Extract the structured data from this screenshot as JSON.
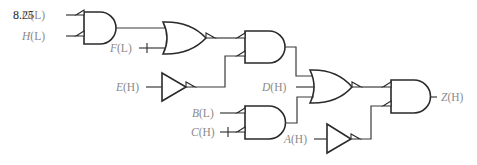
{
  "figure": {
    "number": "8.25",
    "type": "logic-circuit",
    "colors": {
      "gate_stroke": "#2a2a2a",
      "wire": "#3a3a3a",
      "label": "#8a8a8a",
      "figure_number": "#1a1a1a"
    }
  },
  "inputs": [
    {
      "id": "G",
      "letter": "G",
      "polarity": "(L)",
      "label": "G(L)"
    },
    {
      "id": "H",
      "letter": "H",
      "polarity": "(L)",
      "label": "H(L)"
    },
    {
      "id": "F",
      "letter": "F",
      "polarity": "(L)",
      "label": "F(L)",
      "mismatch_tick": true
    },
    {
      "id": "E",
      "letter": "E",
      "polarity": "(H)",
      "label": "E(H)"
    },
    {
      "id": "D",
      "letter": "D",
      "polarity": "(H)",
      "label": "D(H)"
    },
    {
      "id": "B",
      "letter": "B",
      "polarity": "(L)",
      "label": "B(L)"
    },
    {
      "id": "C",
      "letter": "C",
      "polarity": "(H)",
      "label": "C(H)",
      "mismatch_tick": true
    },
    {
      "id": "A",
      "letter": "A",
      "polarity": "(H)",
      "label": "A(H)"
    }
  ],
  "outputs": [
    {
      "id": "Z",
      "letter": "Z",
      "polarity": "(H)",
      "label": "Z(H)"
    }
  ],
  "gates": [
    {
      "id": "and1",
      "type": "AND",
      "inputs": [
        "G",
        "H"
      ],
      "input_bubbles": true,
      "output_bubble": false
    },
    {
      "id": "or1",
      "type": "OR",
      "inputs": [
        "and1",
        "F"
      ],
      "input_bubbles": false,
      "output_bubble": true
    },
    {
      "id": "buf_e",
      "type": "BUFFER",
      "inputs": [
        "E"
      ],
      "output_bubble": true
    },
    {
      "id": "and2",
      "type": "AND",
      "inputs": [
        "or1",
        "buf_e"
      ],
      "input_bubbles": true,
      "output_bubble": false
    },
    {
      "id": "and4",
      "type": "AND",
      "inputs": [
        "B",
        "C"
      ],
      "input_bubbles": true,
      "output_bubble": false
    },
    {
      "id": "or2",
      "type": "OR",
      "inputs": [
        "and2",
        "D",
        "and4"
      ],
      "input_bubbles": false,
      "output_bubble": true
    },
    {
      "id": "buf_a",
      "type": "BUFFER",
      "inputs": [
        "A"
      ],
      "output_bubble": true
    },
    {
      "id": "and3",
      "type": "AND",
      "inputs": [
        "or2",
        "buf_a"
      ],
      "input_bubbles": true,
      "output_bubble": false,
      "output": "Z"
    }
  ]
}
